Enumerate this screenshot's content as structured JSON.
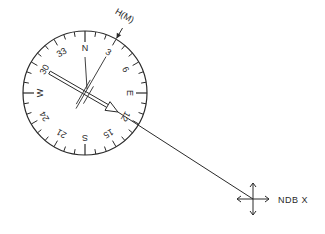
{
  "diagram": {
    "heading_marker": {
      "label": "H(M)",
      "heading_deg": 30
    },
    "compass_card": {
      "cardinal_labels": [
        {
          "label": "N",
          "deg": 0
        },
        {
          "label": "3",
          "deg": 30
        },
        {
          "label": "6",
          "deg": 60
        },
        {
          "label": "E",
          "deg": 90
        },
        {
          "label": "12",
          "deg": 120
        },
        {
          "label": "15",
          "deg": 150
        },
        {
          "label": "S",
          "deg": 180
        },
        {
          "label": "21",
          "deg": 210
        },
        {
          "label": "24",
          "deg": 240
        },
        {
          "label": "W",
          "deg": 270
        },
        {
          "label": "30",
          "deg": 300
        },
        {
          "label": "33",
          "deg": 330
        }
      ],
      "tick_interval_deg": 10
    },
    "needle": {
      "points_to_deg": 120,
      "tail_deg": 300
    },
    "station": {
      "label": "NDB X"
    }
  }
}
